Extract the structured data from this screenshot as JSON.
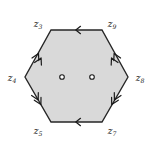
{
  "figure": {
    "shape": "hexagon",
    "fill_color": "#d9d9d9",
    "stroke_color": "#262626",
    "background_color": "#ffffff"
  },
  "labels": {
    "top_left": "z",
    "top_left_sub": "3",
    "top_right": "z",
    "top_right_sub": "9",
    "left": "z",
    "left_sub": "4",
    "right": "z",
    "right_sub": "8",
    "bottom_left": "z",
    "bottom_left_sub": "5",
    "bottom_right": "z",
    "bottom_right_sub": "7"
  },
  "edge_markers": {
    "top": "single-arrow-left",
    "bottom": "single-arrow-left",
    "upper_left": "double-arrow-up",
    "upper_right": "double-arrow-up",
    "lower_left": "double-arrow-up",
    "lower_right": "double-arrow-up"
  },
  "interior_points": {
    "count": "2",
    "style": "open-circle"
  }
}
